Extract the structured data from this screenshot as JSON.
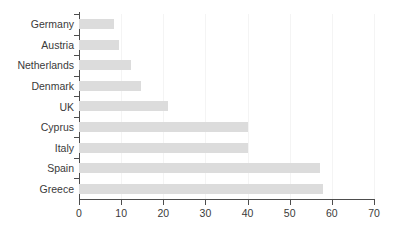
{
  "chart_data": {
    "type": "bar",
    "orientation": "horizontal",
    "title": "",
    "xlabel": "",
    "ylabel": "",
    "xlim": [
      0,
      70
    ],
    "ylim": null,
    "grid": true,
    "grid_axis": "x",
    "legend": null,
    "bar_color": "#dcdcdc",
    "axis_color": "#4d4d4d",
    "text_color": "#3a3a3a",
    "background": "#ffffff",
    "categories": [
      "Germany",
      "Austria",
      "Netherlands",
      "Denmark",
      "UK",
      "Cyprus",
      "Italy",
      "Spain",
      "Greece"
    ],
    "values": [
      8.2,
      9.5,
      12.3,
      14.7,
      21,
      40,
      40,
      57.2,
      58
    ],
    "xticks": [
      0,
      10,
      20,
      30,
      40,
      50,
      60,
      70
    ],
    "xtick_labels": [
      "0",
      "10",
      "20",
      "30",
      "40",
      "50",
      "60",
      "70"
    ]
  }
}
